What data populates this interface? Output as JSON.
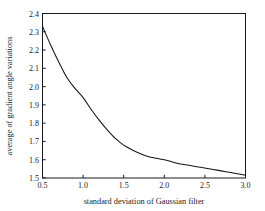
{
  "chart_data": {
    "type": "line",
    "title": "",
    "xlabel": "standard deviation of Gaussian filter",
    "ylabel": "average of gradient angle variations",
    "xlim": [
      0.5,
      3.0
    ],
    "ylim": [
      1.5,
      2.4
    ],
    "xticks": [
      "0.5",
      "1.0",
      "1.5",
      "2.0",
      "2.5",
      "3.0"
    ],
    "xtick_values": [
      0.5,
      1.0,
      1.5,
      2.0,
      2.5,
      3.0
    ],
    "yticks": [
      "1.5",
      "1.6",
      "1.7",
      "1.8",
      "1.9",
      "2.0",
      "2.1",
      "2.2",
      "2.3",
      "2.4"
    ],
    "ytick_values": [
      1.5,
      1.6,
      1.7,
      1.8,
      1.9,
      2.0,
      2.1,
      2.2,
      2.3,
      2.4
    ],
    "grid": false,
    "legend": false,
    "legend_position": "none",
    "line_color": "#141414",
    "background_color": "#ffffff",
    "series": [
      {
        "name": "average of gradient angle variations",
        "x": [
          0.5,
          0.6,
          0.7,
          0.8,
          0.9,
          1.0,
          1.1,
          1.2,
          1.3,
          1.4,
          1.5,
          1.6,
          1.7,
          1.8,
          1.9,
          2.0,
          2.1,
          2.2,
          2.3,
          2.4,
          2.5,
          2.6,
          2.7,
          2.8,
          2.9,
          3.0
        ],
        "values": [
          2.33,
          2.228,
          2.135,
          2.05,
          1.99,
          1.94,
          1.875,
          1.815,
          1.762,
          1.715,
          1.68,
          1.655,
          1.634,
          1.618,
          1.608,
          1.6,
          1.588,
          1.577,
          1.57,
          1.562,
          1.555,
          1.547,
          1.539,
          1.531,
          1.523,
          1.515
        ]
      }
    ]
  }
}
